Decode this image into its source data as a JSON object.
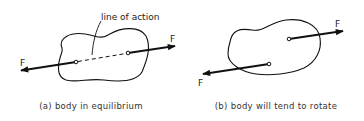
{
  "panels": [
    {
      "id": "a",
      "caption": "(a) body in equilibrium",
      "annotation": "line of action",
      "forces": [
        {
          "label": "F",
          "direction": "left"
        },
        {
          "label": "F",
          "direction": "right"
        }
      ]
    },
    {
      "id": "b",
      "caption": "(b) body will tend to rotate",
      "forces": [
        {
          "label": "F",
          "direction": "right"
        },
        {
          "label": "F",
          "direction": "left"
        }
      ]
    }
  ],
  "colors": {
    "stroke": "#111111",
    "background": "#ffffff"
  }
}
